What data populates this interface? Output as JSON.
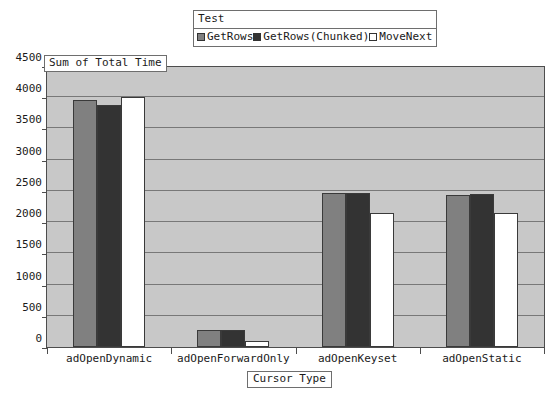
{
  "legend": {
    "title": "Test",
    "entries": [
      {
        "label": "GetRows",
        "color": "#808080"
      },
      {
        "label": "GetRows(Chunked)",
        "color": "#333333"
      },
      {
        "label": "MoveNext",
        "color": "#ffffff"
      }
    ]
  },
  "y_axis_title": "Sum of Total Time",
  "x_axis_title": "Cursor Type",
  "chart_data": {
    "type": "bar",
    "title": "",
    "xlabel": "Cursor Type",
    "ylabel": "Sum of Total Time",
    "categories": [
      "adOpenDynamic",
      "adOpenForwardOnly",
      "adOpenKeyset",
      "adOpenStatic"
    ],
    "series": [
      {
        "name": "GetRows",
        "color": "#808080",
        "values": [
          3950,
          270,
          2460,
          2440
        ]
      },
      {
        "name": "GetRows(Chunked)",
        "color": "#333333",
        "values": [
          3870,
          265,
          2470,
          2450
        ]
      },
      {
        "name": "MoveNext",
        "color": "#ffffff",
        "values": [
          4000,
          100,
          2150,
          2140
        ]
      }
    ],
    "ylim": [
      0,
      4500
    ],
    "ytick_values": [
      0,
      500,
      1000,
      1500,
      2000,
      2500,
      3000,
      3500,
      4000,
      4500
    ],
    "ytick_labels": [
      "0",
      "500",
      "1000",
      "1500",
      "2000",
      "2500",
      "3000",
      "3500",
      "4000",
      "4500"
    ],
    "grid": true,
    "legend_position": "top-center",
    "plot_background": "#c8c8c8",
    "gridline_color": "#787878"
  }
}
